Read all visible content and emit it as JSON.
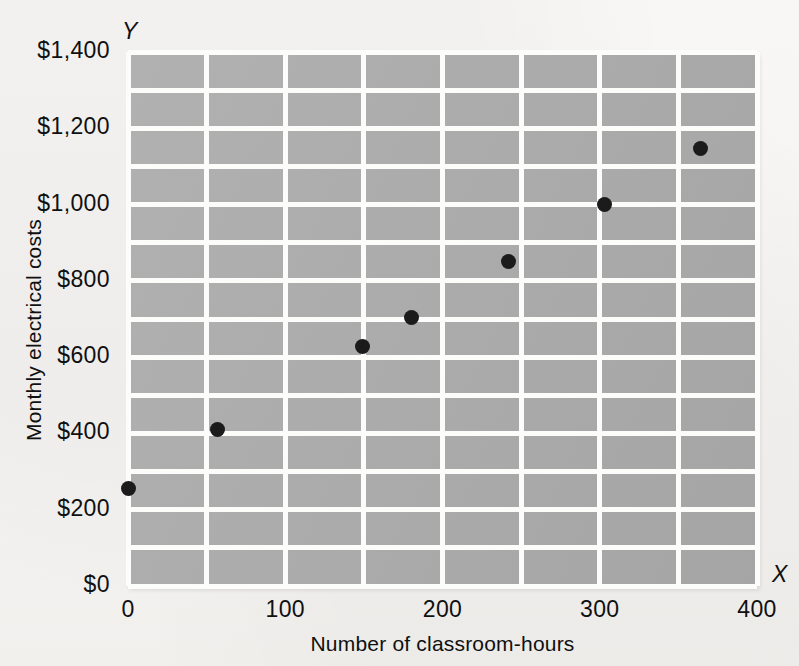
{
  "chart_data": {
    "type": "scatter",
    "title": "",
    "xlabel": "Number of classroom-hours",
    "ylabel": "Monthly electrical costs",
    "axis_letter_x": "X",
    "axis_letter_y": "Y",
    "xlim": [
      0,
      400
    ],
    "ylim": [
      0,
      1400
    ],
    "xticks": [
      0,
      100,
      200,
      300,
      400
    ],
    "xtick_labels": [
      "0",
      "100",
      "200",
      "300",
      "400"
    ],
    "yticks": [
      0,
      200,
      400,
      600,
      800,
      1000,
      1200,
      1400
    ],
    "ytick_labels": [
      "$0",
      "$200",
      "$400",
      "$600",
      "$800",
      "$1,000",
      "$1,200",
      "$1,400"
    ],
    "x_gridline_step": 50,
    "y_gridline_step": 100,
    "grid": true,
    "legend": null,
    "series": [
      {
        "name": "Monthly electrical costs vs classroom-hours",
        "points": [
          {
            "x": 0,
            "y": 255
          },
          {
            "x": 57,
            "y": 410
          },
          {
            "x": 149,
            "y": 627
          },
          {
            "x": 180,
            "y": 703
          },
          {
            "x": 242,
            "y": 852
          },
          {
            "x": 303,
            "y": 1000
          },
          {
            "x": 364,
            "y": 1148
          }
        ]
      }
    ],
    "colors": {
      "plot_background": "#ababab",
      "gridline": "#fcfcfa",
      "point": "#1b1b1b",
      "page_background": "#f6f5f3",
      "text": "#101010"
    }
  }
}
